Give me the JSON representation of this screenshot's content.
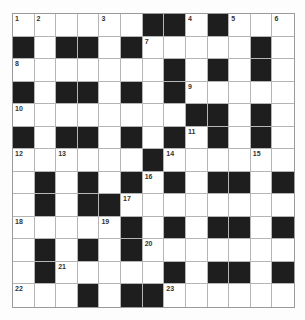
{
  "puzzle": {
    "type": "crossword",
    "rows": 13,
    "cols": 13,
    "colors": {
      "block": "#1e1e1e",
      "cell": "#ffffff",
      "gridline": "#b5b5b5",
      "number": "#333333"
    },
    "layout": [
      "......##.#...",
      "#.##.#.....#.",
      ".......#.#.#.",
      "#.##.#.#.....",
      "........##.#.",
      "#.##.#.#.#.#.",
      "......#......",
      ".#.#.#.#.##.#",
      ".#.##........",
      ".....#.#.##.#",
      ".#.#.#.......",
      ".#.....#.##.#",
      "...#.##......"
    ],
    "numbers": [
      {
        "n": "1",
        "r": 0,
        "c": 0
      },
      {
        "n": "2",
        "r": 0,
        "c": 1
      },
      {
        "n": "3",
        "r": 0,
        "c": 4
      },
      {
        "n": "4",
        "r": 0,
        "c": 8
      },
      {
        "n": "5",
        "r": 0,
        "c": 10
      },
      {
        "n": "6",
        "r": 0,
        "c": 12
      },
      {
        "n": "7",
        "r": 1,
        "c": 6
      },
      {
        "n": "8",
        "r": 2,
        "c": 0
      },
      {
        "n": "9",
        "r": 3,
        "c": 8
      },
      {
        "n": "10",
        "r": 4,
        "c": 0
      },
      {
        "n": "11",
        "r": 5,
        "c": 8
      },
      {
        "n": "12",
        "r": 6,
        "c": 0
      },
      {
        "n": "13",
        "r": 6,
        "c": 2
      },
      {
        "n": "14",
        "r": 6,
        "c": 7
      },
      {
        "n": "15",
        "r": 6,
        "c": 11
      },
      {
        "n": "16",
        "r": 7,
        "c": 6
      },
      {
        "n": "17",
        "r": 8,
        "c": 5
      },
      {
        "n": "18",
        "r": 9,
        "c": 0
      },
      {
        "n": "19",
        "r": 9,
        "c": 4
      },
      {
        "n": "20",
        "r": 10,
        "c": 6
      },
      {
        "n": "21",
        "r": 11,
        "c": 2
      },
      {
        "n": "22",
        "r": 12,
        "c": 0
      },
      {
        "n": "23",
        "r": 12,
        "c": 7
      }
    ]
  }
}
